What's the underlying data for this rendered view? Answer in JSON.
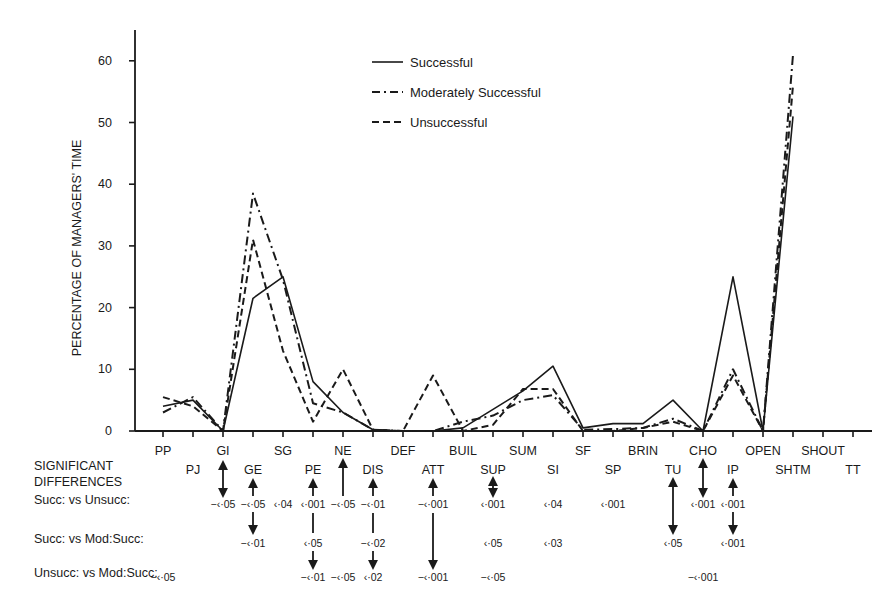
{
  "chart_data": {
    "type": "line",
    "title": "",
    "xlabel": "",
    "ylabel": "PERCENTAGE OF MANAGERS' TIME",
    "ylim": [
      0,
      65
    ],
    "yticks": [
      0,
      10,
      20,
      30,
      40,
      50,
      60
    ],
    "grid": false,
    "legend_position": "top-center",
    "categories": [
      "PP",
      "PJ",
      "GI",
      "GE",
      "SG",
      "PE",
      "NE",
      "DIS",
      "DEF",
      "ATT",
      "BUIL",
      "SUP",
      "SUM",
      "SI",
      "SF",
      "SP",
      "BRIN",
      "TU",
      "CHO",
      "IP",
      "OPEN",
      "SHTM",
      "SHOUT",
      "TT"
    ],
    "upper_row_labels": [
      "PP",
      "GI",
      "SG",
      "NE",
      "DEF",
      "BUIL",
      "SUM",
      "SF",
      "BRIN",
      "CHO",
      "OPEN",
      "SHOUT"
    ],
    "lower_row_labels": [
      "PJ",
      "GE",
      "PE",
      "DIS",
      "ATT",
      "SUP",
      "SI",
      "SP",
      "TU",
      "IP",
      "SHTM",
      "TT"
    ],
    "series": [
      {
        "name": "Successful",
        "style": "solid",
        "values": [
          4,
          5,
          0,
          21.5,
          25,
          8,
          3,
          0.2,
          0,
          0,
          0.5,
          3.5,
          6.5,
          10.5,
          0.5,
          1.2,
          1.2,
          5,
          0,
          25,
          0,
          51,
          null,
          null
        ]
      },
      {
        "name": "Moderately Successful",
        "style": "dash-dot",
        "values": [
          3,
          5.5,
          0,
          38.5,
          24.5,
          4.5,
          3,
          0.2,
          0,
          0,
          1.5,
          2.5,
          5,
          5.8,
          0.2,
          0.3,
          0.5,
          2,
          0,
          10,
          0,
          61,
          null,
          null
        ]
      },
      {
        "name": "Unsuccessful",
        "style": "dashed",
        "values": [
          5.5,
          4,
          0,
          31,
          13,
          1.5,
          10,
          0.2,
          0,
          9,
          0,
          1,
          6.8,
          6.8,
          0,
          0,
          0.5,
          1.5,
          0,
          9,
          0,
          56,
          null,
          null
        ]
      }
    ],
    "significant_differences": {
      "heading": [
        "SIGNIFICANT",
        "DIFFERENCES"
      ],
      "rows": [
        {
          "label": "Succ: vs Unsucc:",
          "entries": [
            {
              "cat": "GI",
              "text": "−‹·05"
            },
            {
              "cat": "GE",
              "text": "−‹·05"
            },
            {
              "cat": "SG",
              "text": "‹·04"
            },
            {
              "cat": "PE",
              "text": "‹·001"
            },
            {
              "cat": "NE",
              "text": "−‹·05"
            },
            {
              "cat": "DIS",
              "text": "−‹·01"
            },
            {
              "cat": "ATT",
              "text": "−‹·001"
            },
            {
              "cat": "SUP",
              "text": "‹·001"
            },
            {
              "cat": "SI",
              "text": "‹·04"
            },
            {
              "cat": "SP",
              "text": "‹·001"
            },
            {
              "cat": "CHO",
              "text": "‹·001"
            },
            {
              "cat": "IP",
              "text": "‹·001"
            }
          ]
        },
        {
          "label": "Succ: vs Mod:Succ:",
          "entries": [
            {
              "cat": "GE",
              "text": "−‹·01"
            },
            {
              "cat": "PE",
              "text": "‹·05"
            },
            {
              "cat": "DIS",
              "text": "−‹·02"
            },
            {
              "cat": "SUP",
              "text": "‹·05"
            },
            {
              "cat": "SI",
              "text": "‹·03"
            },
            {
              "cat": "TU",
              "text": "‹·05"
            },
            {
              "cat": "IP",
              "text": "‹·001"
            }
          ]
        },
        {
          "label": "Unsucc: vs Mod:Succ:",
          "entries": [
            {
              "cat": "PP",
              "text": "−‹·05"
            },
            {
              "cat": "PE",
              "text": "−‹·01"
            },
            {
              "cat": "NE",
              "text": "−‹·05"
            },
            {
              "cat": "DIS",
              "text": "‹·02"
            },
            {
              "cat": "ATT",
              "text": "−‹·001"
            },
            {
              "cat": "SUP",
              "text": "−‹·05"
            },
            {
              "cat": "CHO",
              "text": "−‹·001"
            }
          ]
        }
      ]
    }
  },
  "legend": {
    "items": [
      {
        "label": "Successful",
        "style": "solid"
      },
      {
        "label": "Moderately Successful",
        "style": "dash-dot"
      },
      {
        "label": "Unsuccessful",
        "style": "dashed"
      }
    ]
  },
  "colors": {
    "ink": "#1a1a1a",
    "background": "#ffffff"
  }
}
